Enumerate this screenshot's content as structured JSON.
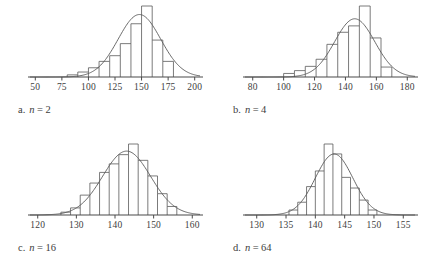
{
  "figure": {
    "stroke_color": "#595959",
    "axis_color": "#4a4a4a",
    "background": "#ffffff"
  },
  "panels": [
    {
      "id": "a",
      "caption_letter": "a.",
      "caption_var": "n",
      "caption_eq": "=",
      "caption_value": "2"
    },
    {
      "id": "b",
      "caption_letter": "b.",
      "caption_var": "n",
      "caption_eq": "=",
      "caption_value": "4"
    },
    {
      "id": "c",
      "caption_letter": "c.",
      "caption_var": "n",
      "caption_eq": "=",
      "caption_value": "16"
    },
    {
      "id": "d",
      "caption_letter": "d.",
      "caption_var": "n",
      "caption_eq": "=",
      "caption_value": "64"
    }
  ],
  "chart_data": [
    {
      "id": "a",
      "type": "bar",
      "title": "",
      "xlabel": "",
      "ylabel": "",
      "grid": false,
      "legend": "none",
      "xlim": [
        45,
        205
      ],
      "ylim": [
        0,
        1.0
      ],
      "ticks": [
        50,
        75,
        100,
        125,
        150,
        175,
        200
      ],
      "tick_labels": [
        "50",
        "75",
        "100",
        "125",
        "150",
        "175",
        "200"
      ],
      "bin_edges": [
        80,
        90,
        100,
        110,
        120,
        130,
        140,
        150,
        160,
        170,
        180
      ],
      "values": [
        0.03,
        0.07,
        0.13,
        0.22,
        0.3,
        0.47,
        0.75,
        1.0,
        0.52,
        0.22
      ],
      "curve": {
        "name": "normal curve",
        "mean": 148,
        "sd": 20,
        "peak": 0.88
      }
    },
    {
      "id": "b",
      "type": "bar",
      "title": "",
      "xlabel": "",
      "ylabel": "",
      "grid": false,
      "legend": "none",
      "xlim": [
        75,
        185
      ],
      "ylim": [
        0,
        1.0
      ],
      "ticks": [
        80,
        100,
        120,
        140,
        160,
        180
      ],
      "tick_labels": [
        "80",
        "100",
        "120",
        "140",
        "160",
        "180"
      ],
      "bin_edges": [
        100,
        107,
        114,
        121,
        128,
        135,
        142,
        149,
        156,
        163,
        170
      ],
      "values": [
        0.05,
        0.09,
        0.15,
        0.25,
        0.46,
        0.63,
        0.72,
        1.0,
        0.55,
        0.14
      ],
      "curve": {
        "name": "normal curve",
        "mean": 146,
        "sd": 13,
        "peak": 0.82
      }
    },
    {
      "id": "c",
      "type": "bar",
      "title": "",
      "xlabel": "",
      "ylabel": "",
      "grid": false,
      "legend": "none",
      "xlim": [
        118,
        162
      ],
      "ylim": [
        0,
        1.0
      ],
      "ticks": [
        120,
        130,
        140,
        150,
        160
      ],
      "tick_labels": [
        "120",
        "130",
        "140",
        "150",
        "160"
      ],
      "bin_edges": [
        126,
        128.5,
        131,
        133.5,
        136,
        138.5,
        141,
        143.5,
        146,
        148.5,
        151,
        153.5,
        156
      ],
      "values": [
        0.04,
        0.1,
        0.28,
        0.45,
        0.6,
        0.72,
        0.85,
        1.0,
        0.77,
        0.55,
        0.3,
        0.12
      ],
      "curve": {
        "name": "normal curve",
        "mean": 143,
        "sd": 6.2,
        "peak": 0.9
      }
    },
    {
      "id": "d",
      "type": "bar",
      "title": "",
      "xlabel": "",
      "ylabel": "",
      "grid": false,
      "legend": "none",
      "xlim": [
        128,
        157
      ],
      "ylim": [
        0,
        1.0
      ],
      "ticks": [
        130,
        135,
        140,
        145,
        150,
        155
      ],
      "tick_labels": [
        "130",
        "135",
        "140",
        "145",
        "150",
        "155"
      ],
      "bin_edges": [
        135.5,
        137,
        138.5,
        140,
        141.5,
        143,
        144.5,
        146,
        147.5,
        149,
        150.5
      ],
      "values": [
        0.07,
        0.18,
        0.4,
        0.62,
        1.0,
        0.86,
        0.53,
        0.38,
        0.21,
        0.07
      ],
      "curve": {
        "name": "normal curve",
        "mean": 143.2,
        "sd": 3.2,
        "peak": 0.86
      }
    }
  ]
}
